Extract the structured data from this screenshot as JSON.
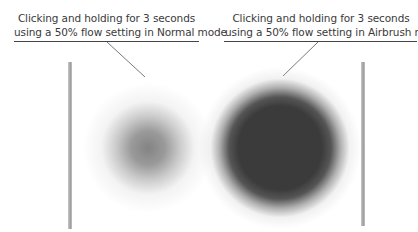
{
  "figure": {
    "captions": {
      "normal": {
        "line1": "Clicking and holding for 3 seconds",
        "line2": "using a 50% flow setting in Normal mode"
      },
      "airbrush": {
        "line1": "Clicking and holding for 3 seconds",
        "line2": "using a 50% flow setting in Airbrush mode"
      }
    },
    "samples": [
      {
        "label": "Normal mode stroke",
        "mode": "Normal",
        "flow": "50%",
        "duration": "3 seconds"
      },
      {
        "label": "Airbrush mode stroke",
        "mode": "Airbrush",
        "flow": "50%",
        "duration": "3 seconds"
      }
    ],
    "colors": {
      "text": "#3a3a3a",
      "rule": "#444444",
      "bar": "#a8a8a8",
      "normal_core": "#6e6e6e",
      "airbrush_core": "#3b3b3b"
    }
  }
}
